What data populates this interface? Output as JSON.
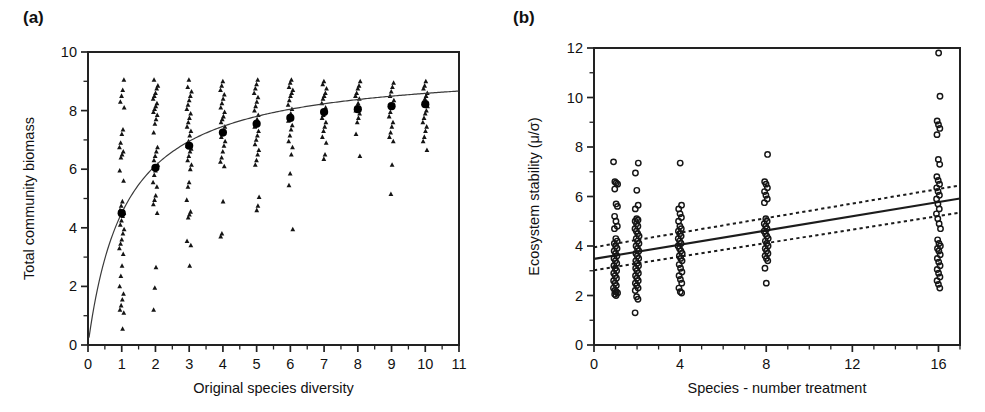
{
  "figure": {
    "panels": [
      {
        "id": "a",
        "label": "(a)"
      },
      {
        "id": "b",
        "label": "(b)"
      }
    ]
  },
  "chart_data": [
    {
      "panel": "a",
      "type": "scatter",
      "title": "(a)",
      "xlabel": "Original species diversity",
      "ylabel": "Total community biomass",
      "xlim": [
        0,
        11
      ],
      "ylim": [
        0,
        10
      ],
      "xticks": [
        0,
        1,
        2,
        3,
        4,
        5,
        6,
        7,
        8,
        9,
        10,
        11
      ],
      "xtick_labels": [
        "0",
        "1",
        "2",
        "3",
        "4",
        "5",
        "6",
        "7",
        "8",
        "9",
        "10",
        "11"
      ],
      "yticks": [
        0,
        2,
        4,
        6,
        8,
        10
      ],
      "ytick_labels": [
        "0",
        "2",
        "4",
        "6",
        "8",
        "10"
      ],
      "yticks_minor": [
        1,
        3,
        5,
        7,
        9
      ],
      "grid": false,
      "legend": "none",
      "marker": "triangle",
      "mean_marker": "filled-circle",
      "fit_type": "saturating-curve",
      "fit_note": "Michaelis-Menten style saturating curve through group means",
      "series": [
        {
          "name": "Replicate plots",
          "x": [
            1,
            2,
            3,
            4,
            5,
            6,
            7,
            8,
            9,
            10
          ],
          "y_by_x": {
            "1": [
              0.55,
              1.1,
              1.2,
              1.35,
              1.55,
              1.75,
              2.0,
              2.35,
              2.7,
              3.1,
              3.3,
              3.45,
              3.6,
              3.8,
              3.95,
              4.1,
              4.25,
              4.4,
              4.5,
              4.6,
              4.75,
              4.9,
              5.6,
              5.95,
              6.4,
              6.5,
              6.6,
              6.75,
              6.9,
              7.2,
              7.35,
              8.1,
              8.3,
              8.5,
              8.7,
              9.05
            ],
            "2": [
              1.2,
              1.95,
              2.65,
              4.5,
              4.8,
              4.95,
              5.1,
              5.4,
              5.55,
              5.8,
              5.95,
              6.05,
              6.15,
              6.3,
              6.45,
              6.6,
              6.75,
              7.25,
              7.55,
              7.7,
              7.85,
              7.95,
              8.05,
              8.15,
              8.25,
              8.4,
              8.5,
              8.6,
              8.75,
              8.85,
              9.05
            ],
            "3": [
              2.7,
              3.4,
              3.55,
              4.35,
              4.45,
              4.55,
              4.95,
              5.4,
              5.55,
              6.0,
              6.15,
              6.3,
              6.45,
              6.6,
              6.7,
              6.8,
              6.95,
              7.15,
              7.3,
              7.45,
              7.6,
              7.75,
              7.9,
              8.05,
              8.2,
              8.35,
              8.5,
              8.65,
              8.8,
              9.05
            ],
            "4": [
              3.7,
              3.8,
              4.9,
              6.1,
              6.25,
              6.4,
              6.6,
              6.8,
              6.95,
              7.1,
              7.2,
              7.3,
              7.45,
              7.6,
              7.7,
              7.8,
              7.95,
              8.1,
              8.25,
              8.4,
              8.55,
              8.7,
              8.85,
              9.0
            ],
            "5": [
              4.6,
              4.75,
              5.05,
              6.15,
              6.3,
              6.5,
              6.65,
              6.85,
              7.0,
              7.15,
              7.3,
              7.45,
              7.55,
              7.7,
              7.85,
              8.0,
              8.15,
              8.3,
              8.45,
              8.6,
              8.75,
              8.9,
              9.05
            ],
            "6": [
              3.95,
              5.45,
              5.85,
              6.5,
              6.75,
              6.95,
              7.15,
              7.35,
              7.5,
              7.65,
              7.75,
              7.9,
              8.05,
              8.2,
              8.35,
              8.5,
              8.6,
              8.7,
              8.8,
              8.95,
              9.05
            ],
            "7": [
              6.35,
              6.5,
              6.9,
              7.1,
              7.3,
              7.45,
              7.6,
              7.75,
              7.85,
              7.95,
              8.1,
              8.25,
              8.4,
              8.5,
              8.6,
              8.75,
              8.9,
              9.0
            ],
            "8": [
              6.45,
              7.2,
              7.6,
              7.75,
              7.9,
              8.0,
              8.1,
              8.25,
              8.4,
              8.5,
              8.6,
              8.75,
              8.85,
              9.0
            ],
            "9": [
              5.15,
              6.15,
              6.95,
              7.1,
              7.25,
              7.45,
              7.6,
              7.8,
              7.95,
              8.1,
              8.2,
              8.35,
              8.5,
              8.65,
              8.8,
              8.95
            ],
            "10": [
              6.65,
              6.95,
              7.1,
              7.3,
              7.45,
              7.6,
              7.75,
              7.9,
              8.0,
              8.15,
              8.25,
              8.4,
              8.5,
              8.6,
              8.75,
              8.85,
              9.0
            ]
          }
        }
      ],
      "means": {
        "x": [
          1,
          2,
          3,
          4,
          5,
          6,
          7,
          8,
          9,
          10
        ],
        "y": [
          4.5,
          6.05,
          6.8,
          7.25,
          7.55,
          7.75,
          7.95,
          8.05,
          8.15,
          8.22
        ]
      }
    },
    {
      "panel": "b",
      "type": "scatter",
      "title": "(b)",
      "xlabel": "Species - number treatment",
      "ylabel": "Ecosystem stability (μ/σ)",
      "xlim": [
        0,
        17
      ],
      "ylim": [
        0,
        12
      ],
      "xticks": [
        0,
        4,
        8,
        12,
        16
      ],
      "xtick_labels": [
        "0",
        "4",
        "8",
        "12",
        "16"
      ],
      "xticks_minor": [
        1,
        2,
        3,
        5,
        6,
        7,
        9,
        10,
        11,
        13,
        14,
        15,
        17
      ],
      "yticks": [
        0,
        2,
        4,
        6,
        8,
        10,
        12
      ],
      "ytick_labels": [
        "0",
        "2",
        "4",
        "6",
        "8",
        "10",
        "12"
      ],
      "yticks_minor": [
        1,
        3,
        5,
        7,
        9,
        11
      ],
      "grid": false,
      "legend": "none",
      "marker": "open-circle",
      "fit_type": "linear-regression-with-confidence-band",
      "regression": {
        "x": [
          0,
          17
        ],
        "y": [
          3.48,
          5.92
        ]
      },
      "confidence_upper": {
        "x": [
          0,
          17
        ],
        "y": [
          3.95,
          6.45
        ]
      },
      "confidence_lower": {
        "x": [
          0,
          17
        ],
        "y": [
          3.02,
          5.35
        ]
      },
      "series": [
        {
          "name": "Replicate plots",
          "x": [
            1,
            2,
            4,
            8,
            16
          ],
          "y_by_x": {
            "1": [
              2.0,
              2.05,
              2.1,
              2.15,
              2.2,
              2.3,
              2.4,
              2.5,
              2.6,
              2.7,
              2.8,
              2.9,
              3.0,
              3.1,
              3.2,
              3.3,
              3.4,
              3.5,
              3.6,
              3.7,
              3.8,
              3.9,
              4.0,
              4.1,
              4.2,
              4.3,
              4.7,
              4.8,
              5.0,
              5.2,
              5.6,
              5.7,
              6.3,
              6.5,
              6.55,
              6.6,
              7.4
            ],
            "2": [
              1.3,
              1.85,
              1.95,
              2.2,
              2.3,
              2.4,
              2.5,
              2.6,
              2.7,
              2.8,
              2.9,
              3.0,
              3.1,
              3.2,
              3.3,
              3.4,
              3.5,
              3.6,
              3.7,
              3.8,
              3.9,
              4.0,
              4.1,
              4.2,
              4.3,
              4.4,
              4.5,
              4.6,
              4.7,
              4.8,
              4.9,
              5.0,
              5.05,
              5.1,
              5.5,
              5.65,
              6.25,
              6.95,
              7.35
            ],
            "4": [
              2.1,
              2.15,
              2.3,
              2.5,
              2.65,
              2.8,
              2.95,
              3.1,
              3.25,
              3.4,
              3.5,
              3.6,
              3.7,
              3.8,
              3.9,
              4.0,
              4.1,
              4.2,
              4.3,
              4.4,
              4.5,
              4.6,
              4.7,
              4.8,
              5.0,
              5.15,
              5.3,
              5.5,
              5.65,
              7.35
            ],
            "8": [
              2.5,
              3.1,
              3.4,
              3.5,
              3.6,
              3.7,
              3.8,
              3.9,
              4.0,
              4.1,
              4.2,
              4.3,
              4.4,
              4.5,
              4.6,
              4.7,
              4.8,
              4.9,
              5.0,
              5.1,
              5.75,
              5.9,
              6.05,
              6.2,
              6.35,
              6.5,
              6.6,
              7.7
            ],
            "16": [
              2.3,
              2.45,
              2.6,
              2.75,
              2.9,
              3.05,
              3.2,
              3.35,
              3.5,
              3.65,
              3.8,
              3.9,
              4.0,
              4.1,
              4.25,
              4.7,
              4.9,
              5.1,
              5.3,
              5.5,
              5.7,
              5.9,
              6.05,
              6.2,
              6.35,
              6.5,
              6.65,
              6.8,
              7.3,
              7.5,
              8.5,
              8.75,
              8.9,
              9.05,
              10.05,
              11.8
            ]
          }
        }
      ]
    }
  ]
}
